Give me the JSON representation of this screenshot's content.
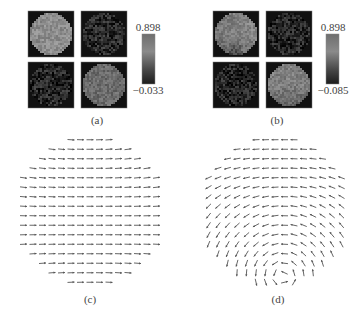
{
  "figure": {
    "panels": [
      {
        "id": "a",
        "label": "(a)",
        "type": "image-grid",
        "tiles": [
          {
            "position": "top-left",
            "level": 0.55,
            "noise": 0.04,
            "gradient": "none"
          },
          {
            "position": "top-right",
            "level": 0.16,
            "noise": 0.07,
            "gradient": "none"
          },
          {
            "position": "bottom-left",
            "level": 0.15,
            "noise": 0.07,
            "gradient": "none"
          },
          {
            "position": "bottom-right",
            "level": 0.42,
            "noise": 0.04,
            "gradient": "none"
          }
        ],
        "colorbar": {
          "max_label": "0.898",
          "min_label": "−0.033",
          "max": 0.898,
          "min": -0.033
        }
      },
      {
        "id": "b",
        "label": "(b)",
        "type": "image-grid",
        "tiles": [
          {
            "position": "top-left",
            "level": 0.5,
            "noise": 0.04,
            "gradient": "bottom-dark-wedge"
          },
          {
            "position": "top-right",
            "level": 0.15,
            "noise": 0.07,
            "gradient": "none"
          },
          {
            "position": "bottom-left",
            "level": 0.14,
            "noise": 0.07,
            "gradient": "none"
          },
          {
            "position": "bottom-right",
            "level": 0.5,
            "noise": 0.04,
            "gradient": "bottom-dark"
          }
        ],
        "colorbar": {
          "max_label": "0.898",
          "min_label": "−0.085",
          "max": 0.898,
          "min": -0.085
        }
      },
      {
        "id": "c",
        "label": "(c)",
        "type": "vector-field",
        "pattern": "uniform-rightward",
        "rows": 16,
        "arrow_color": "#555555"
      },
      {
        "id": "d",
        "label": "(d)",
        "type": "vector-field",
        "pattern": "curl-vortex-bottom-center",
        "rows": 16,
        "arrow_color": "#555555"
      }
    ]
  },
  "colors": {
    "tile_background": "#111111",
    "tile_border": "#777777",
    "background": "#ffffff"
  }
}
